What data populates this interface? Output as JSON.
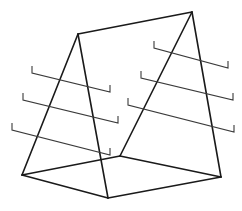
{
  "figure": {
    "type": "line-drawing",
    "canvas": {
      "width": 242,
      "height": 211,
      "background": "#ffffff"
    },
    "stroke": {
      "frame_color": "#1a1a1a",
      "frame_width": 1.6,
      "rail_color": "#3a3a3a",
      "rail_width": 1.1
    },
    "vertices": {
      "apex_left": {
        "x": 78,
        "y": 34
      },
      "apex_right": {
        "x": 192,
        "y": 12
      },
      "base_left": {
        "x": 22,
        "y": 175
      },
      "base_front": {
        "x": 108,
        "y": 198
      },
      "base_right": {
        "x": 221,
        "y": 177
      },
      "base_back": {
        "x": 120,
        "y": 156
      },
      "leg_left_front_foot": {
        "x": 108,
        "y": 198
      },
      "leg_left_back_foot": {
        "x": 22,
        "y": 175
      },
      "leg_right_front_foot": {
        "x": 221,
        "y": 177
      },
      "leg_right_back_foot": {
        "x": 120,
        "y": 156
      }
    },
    "frame_edges": [
      {
        "name": "ridge-beam",
        "points": "78,34 192,12"
      },
      {
        "name": "left-frame-back-leg",
        "points": "78,34 22,175"
      },
      {
        "name": "left-frame-front-leg",
        "points": "78,34 108,198"
      },
      {
        "name": "right-frame-back-leg",
        "points": "192,12 120,156"
      },
      {
        "name": "right-frame-front-leg",
        "points": "192,12 221,177"
      },
      {
        "name": "base-left-front",
        "points": "22,175 108,198"
      },
      {
        "name": "base-front-right",
        "points": "108,198 221,177"
      },
      {
        "name": "base-right-back",
        "points": "221,177 120,156"
      },
      {
        "name": "base-back-left",
        "points": "120,156 22,175"
      }
    ],
    "rails": [
      {
        "name": "left-rail-upper",
        "points": "32,66 32,73 110,92 110,85"
      },
      {
        "name": "left-rail-middle",
        "points": "23,93 23,100 118,123 118,116"
      },
      {
        "name": "left-rail-lower",
        "points": "12,123 12,130 110,155 110,148"
      },
      {
        "name": "right-rail-upper",
        "points": "154,41 154,48 228,68 228,61"
      },
      {
        "name": "right-rail-middle",
        "points": "141,71 141,78 233,100 233,93"
      },
      {
        "name": "right-rail-lower",
        "points": "128,98 128,105 234,132 234,125"
      }
    ],
    "labels": {
      "caption": "",
      "notes": ""
    }
  }
}
